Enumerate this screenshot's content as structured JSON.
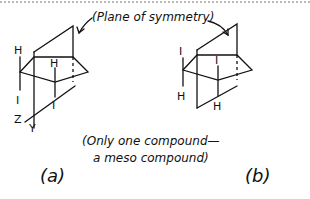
{
  "figure": {
    "annotation": "(Plane of symmetry)",
    "caption_line1": "(Only one compound—",
    "caption_line2": "a meso compound)",
    "panel_a_label": "(a)",
    "panel_b_label": "(b)"
  },
  "structure_a": {
    "left_top_sub": "H",
    "left_bottom_sub": "I",
    "center_top_sub": "H",
    "center_bottom_sub": "I",
    "axis_z": "Z",
    "axis_y": "Y"
  },
  "structure_b": {
    "left_top_sub": "I",
    "left_bottom_sub": "H",
    "center_top_sub": "I",
    "center_bottom_sub": "H"
  }
}
